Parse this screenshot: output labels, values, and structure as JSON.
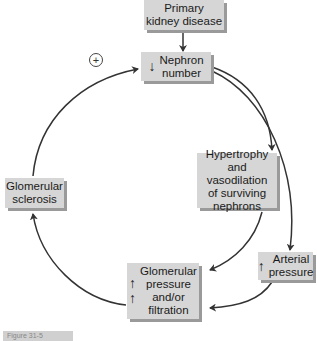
{
  "diagram": {
    "nodes": {
      "primary": {
        "label": "Primary kidney disease",
        "lines": [
          "Primary",
          "kidney disease"
        ]
      },
      "nephron": {
        "label": "Nephron number",
        "lines": [
          "Nephron",
          "number"
        ],
        "indicator": "↓"
      },
      "hypertrophy": {
        "label": "Hypertrophy and vasodilation of surviving nephrons",
        "lines": [
          "Hypertrophy",
          "and vasodilation",
          "of surviving",
          "nephrons"
        ]
      },
      "arterial": {
        "label": "Arterial pressure",
        "lines": [
          "Arterial",
          "pressure"
        ],
        "indicator": "↑"
      },
      "glomerular_pf": {
        "label": "Glomerular pressure and/or filtration",
        "lines": [
          "Glomerular",
          "pressure",
          "and/or",
          "filtration"
        ],
        "indicators": [
          "↑",
          "↑"
        ]
      },
      "sclerosis": {
        "label": "Glomerular sclerosis",
        "lines": [
          "Glomerular",
          "sclerosis"
        ]
      }
    },
    "feedback_symbol": "+",
    "edges": [
      {
        "from": "primary",
        "to": "nephron"
      },
      {
        "from": "nephron",
        "to": "hypertrophy"
      },
      {
        "from": "nephron",
        "to": "arterial"
      },
      {
        "from": "hypertrophy",
        "to": "glomerular_pf"
      },
      {
        "from": "arterial",
        "to": "glomerular_pf"
      },
      {
        "from": "glomerular_pf",
        "to": "sclerosis"
      },
      {
        "from": "sclerosis",
        "to": "nephron"
      }
    ],
    "colors": {
      "box": "#d6d6d6",
      "shadow": "#9a9a9a",
      "line": "#333333"
    },
    "figure_label": "Figure 31-5"
  }
}
